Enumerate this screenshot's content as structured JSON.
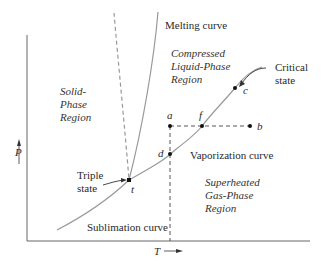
{
  "figure": {
    "axes": {
      "x_label": "T",
      "y_label": "P"
    },
    "curves": {
      "melting": "Melting curve",
      "vaporization": "Vaporization curve",
      "sublimation": "Sublimation curve"
    },
    "regions": {
      "solid": "Solid-\nPhase\nRegion",
      "liquid": "Compressed\nLiquid-Phase\nRegion",
      "gas": "Superheated\nGas-Phase\nRegion"
    },
    "states": {
      "triple_label": "Triple\nstate",
      "triple_point": "t",
      "critical_label": "Critical\nstate",
      "critical_point": "c"
    },
    "points": {
      "a": "a",
      "b": "b",
      "d": "d",
      "f": "f"
    },
    "colors": {
      "curve": "#9a9a9a",
      "axis": "#555555",
      "dash": "#444444",
      "point": "#111111"
    }
  }
}
